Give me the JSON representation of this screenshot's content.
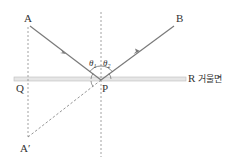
{
  "diagram": {
    "points": {
      "A": "A",
      "B": "B",
      "P": "P",
      "Q": "Q",
      "A_prime": "A′",
      "R": "R"
    },
    "angles": {
      "incidence": "θ1",
      "reflection": "θ2",
      "theta_symbol": "θ",
      "sub1": "1",
      "sub2": "2"
    },
    "mirror_label": "거울면",
    "colors": {
      "ray": "#7a7a7a",
      "dashed": "#8a8a8a",
      "mirror": "#cfcfcf",
      "text": "#333333"
    }
  }
}
